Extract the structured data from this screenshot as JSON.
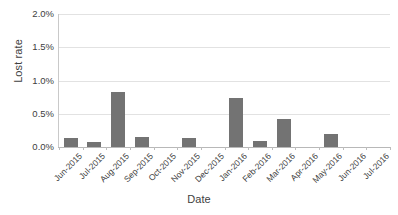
{
  "chart_data": {
    "type": "bar",
    "title": "",
    "xlabel": "Date",
    "ylabel": "Lost rate",
    "categories": [
      "Jun-2015",
      "Jul-2015",
      "Aug-2015",
      "Sep-2015",
      "Oct-2015",
      "Nov-2015",
      "Dec-2015",
      "Jan-2016",
      "Feb-2016",
      "Mar-2016",
      "Apr-2016",
      "May-2016",
      "Jun-2016",
      "Jul-2016"
    ],
    "values": [
      0.13,
      0.07,
      0.83,
      0.15,
      0.0,
      0.13,
      0.0,
      0.73,
      0.09,
      0.42,
      0.0,
      0.2,
      0.0,
      0.0
    ],
    "value_unit": "%",
    "ylim": [
      0,
      2.0
    ],
    "ytick_labels": [
      "0.0%",
      "0.5%",
      "1.0%",
      "1.5%",
      "2.0%"
    ],
    "ytick_values": [
      0.0,
      0.5,
      1.0,
      1.5,
      2.0
    ],
    "grid": true,
    "legend": false,
    "series_color": "#737373",
    "gridline_color": "#e2e2e2",
    "axis_color": "#b8b8b8"
  }
}
